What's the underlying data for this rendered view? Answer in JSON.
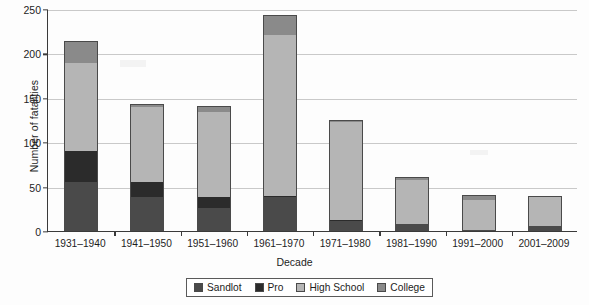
{
  "chart_data": {
    "type": "bar",
    "subtype": "stacked-vertical",
    "title": "",
    "xlabel": "Decade",
    "ylabel": "Number of fatalities",
    "ylim": [
      0,
      250
    ],
    "yticks": [
      0,
      50,
      100,
      150,
      200,
      250
    ],
    "grid": "horizontal",
    "legend_position": "bottom-center",
    "categories": [
      "1931–1940",
      "1941–1950",
      "1951–1960",
      "1961–1970",
      "1971–1980",
      "1981–1990",
      "1991–2000",
      "2001–2009"
    ],
    "series": [
      {
        "name": "Sandlot",
        "color": "#4a4a4a",
        "values": [
          55,
          38,
          26,
          38,
          11,
          8,
          0,
          6
        ]
      },
      {
        "name": "Pro",
        "color": "#2b2b2b",
        "values": [
          35,
          17,
          12,
          2,
          1,
          0,
          0,
          0
        ]
      },
      {
        "name": "High School",
        "color": "#b5b5b5",
        "values": [
          99,
          85,
          96,
          181,
          111,
          50,
          35,
          34
        ]
      },
      {
        "name": "College",
        "color": "#8a8a8a",
        "values": [
          25,
          3,
          7,
          22,
          2,
          3,
          5,
          0
        ]
      }
    ],
    "totals": [
      214,
      143,
      141,
      243,
      125,
      61,
      40,
      40
    ],
    "annotations": []
  },
  "axis": {
    "yticklabels": [
      "250",
      "200",
      "150",
      "100",
      "50",
      "0"
    ],
    "ylabel": "Number of fatalities",
    "xlabel": "Decade"
  },
  "legend": {
    "items": [
      {
        "label": "Sandlot",
        "color": "#4a4a4a"
      },
      {
        "label": "Pro",
        "color": "#2b2b2b"
      },
      {
        "label": "High School",
        "color": "#b5b5b5"
      },
      {
        "label": "College",
        "color": "#8a8a8a"
      }
    ]
  }
}
